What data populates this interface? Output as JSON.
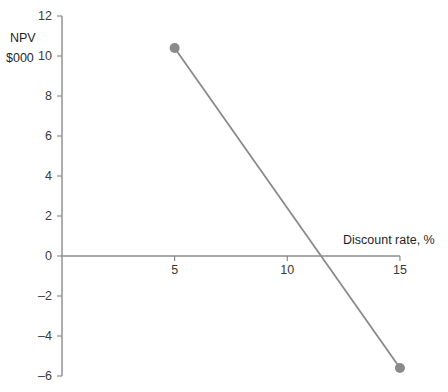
{
  "chart_data": {
    "type": "line",
    "title": "",
    "subtitle": "",
    "xlabel": "Discount rate, %",
    "ylabel_line1": "NPV",
    "ylabel_line2": "$000",
    "ylabel": "NPV $000",
    "x": [
      5,
      15
    ],
    "values": [
      10.4,
      -5.6
    ],
    "series": [
      {
        "name": "NPV profile",
        "x": [
          5,
          15
        ],
        "values": [
          10.4,
          -5.6
        ],
        "color": "#8a8a8a",
        "marker": "circle",
        "marker_color": "#8a8a8a"
      }
    ],
    "xlim": [
      0,
      15
    ],
    "ylim": [
      -6,
      12
    ],
    "xticks": [
      5,
      10,
      15
    ],
    "xticklabels": [
      "5",
      "10",
      "15"
    ],
    "yticks": [
      -6,
      -4,
      -2,
      0,
      2,
      4,
      6,
      8,
      10,
      12
    ],
    "yticklabels": [
      "–6",
      "–4",
      "–2",
      "0",
      "2",
      "4",
      "6",
      "8",
      "10",
      "12"
    ],
    "grid": false,
    "legend": false,
    "legend_position": "none",
    "annotations": [],
    "axis_color": "#8c8c8c",
    "text_color": "#1f1f1f",
    "background": "#ffffff"
  }
}
